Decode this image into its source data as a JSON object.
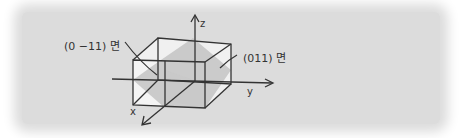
{
  "diagram": {
    "type": "crystal-plane-cube",
    "labels": {
      "plane_left": "(0 −11) 면",
      "plane_right": "(011) 면"
    },
    "axes": {
      "x": "x",
      "y": "y",
      "z": "z"
    },
    "colors": {
      "background": "#dcdcdc",
      "line": "#333333",
      "plane_fill": "#b8b8b8",
      "face_fill": "#f4f4f4"
    }
  }
}
